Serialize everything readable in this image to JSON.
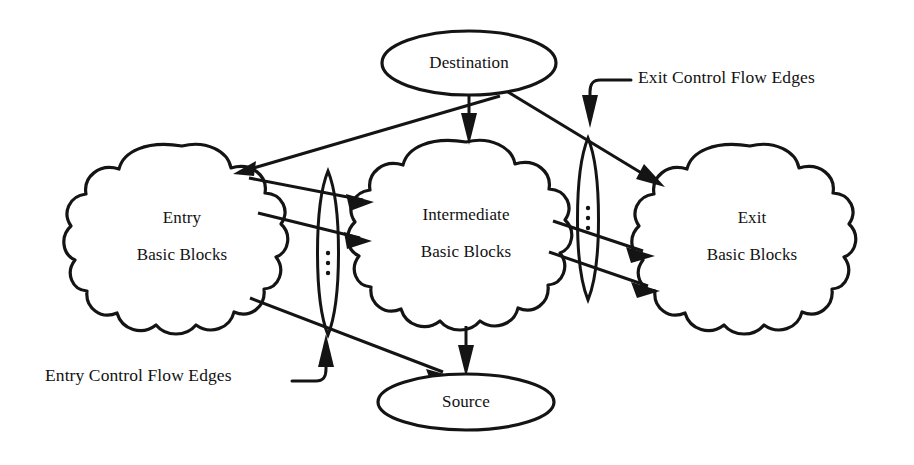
{
  "figure": {
    "background_color": "#ffffff",
    "ink_color": "#141414"
  },
  "nodes": {
    "destination": {
      "name": "destination-ellipse",
      "label": "Destination",
      "shape": "ellipse",
      "cx": 469,
      "cy": 63,
      "rx": 87,
      "ry": 32
    },
    "source": {
      "name": "source-ellipse",
      "label": "Source",
      "shape": "ellipse",
      "cx": 466,
      "cy": 402,
      "rx": 88,
      "ry": 28
    },
    "entry_cloud": {
      "name": "entry-basic-blocks-cloud",
      "label_line_1": "Entry",
      "label_line_2": "Basic Blocks",
      "shape": "cloud",
      "cx": 182,
      "cy": 238
    },
    "intermediate_cloud": {
      "name": "intermediate-basic-blocks-cloud",
      "label_line_1": "Intermediate",
      "label_line_2": "Basic Blocks",
      "shape": "cloud",
      "cx": 466,
      "cy": 235
    },
    "exit_cloud": {
      "name": "exit-basic-blocks-cloud",
      "label_line_1": "Exit",
      "label_line_2": "Basic Blocks",
      "shape": "cloud",
      "cx": 750,
      "cy": 238
    }
  },
  "edge_bundles": {
    "entry_bundle": {
      "name": "entry-edge-bundle-lens",
      "ellipsis": "⋮",
      "cx": 328,
      "cy": 253,
      "rx": 12,
      "ry": 82
    },
    "exit_bundle": {
      "name": "exit-edge-bundle-lens",
      "ellipsis": "⋮",
      "cx": 588,
      "cy": 219,
      "rx": 12,
      "ry": 81
    }
  },
  "annotations": {
    "entry_edges": {
      "name": "entry-control-flow-edges-annotation",
      "label": "Entry Control Flow Edges",
      "x": 45,
      "y": 377
    },
    "exit_edges": {
      "name": "exit-control-flow-edges-annotation",
      "label": "Exit Control Flow Edges",
      "x": 638,
      "y": 79
    }
  },
  "edges": [
    {
      "name": "destination-to-intermediate",
      "from": "destination",
      "to": "intermediate_cloud",
      "arrow": true
    },
    {
      "name": "destination-to-entry",
      "from": "destination",
      "to": "entry_cloud",
      "arrow": true
    },
    {
      "name": "entry-to-intermediate-upper",
      "from": "entry_cloud",
      "to": "intermediate_cloud",
      "arrow": true
    },
    {
      "name": "entry-to-intermediate-lower",
      "from": "entry_cloud",
      "to": "intermediate_cloud",
      "arrow": true
    },
    {
      "name": "entry-to-source",
      "from": "entry_cloud",
      "to": "source",
      "arrow": true
    },
    {
      "name": "intermediate-to-source",
      "from": "intermediate_cloud",
      "to": "source",
      "arrow": true
    },
    {
      "name": "destination-to-exit",
      "from": "destination",
      "to": "exit_cloud",
      "arrow": true
    },
    {
      "name": "intermediate-to-exit-middle",
      "from": "intermediate_cloud",
      "to": "exit_cloud",
      "arrow": true
    },
    {
      "name": "intermediate-to-exit-lower",
      "from": "intermediate_cloud",
      "to": "exit_cloud",
      "arrow": true
    }
  ]
}
